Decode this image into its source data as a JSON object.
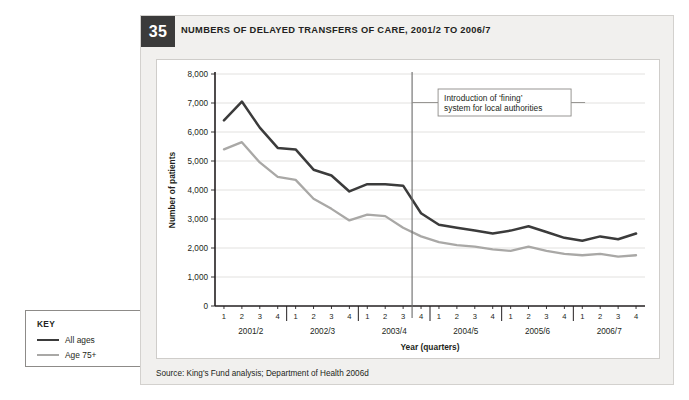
{
  "figure": {
    "number": "35",
    "title": "NUMBERS OF DELAYED TRANSFERS OF CARE, 2001/2 TO 2006/7",
    "source": "Source: King's Fund analysis; Department of Health 2006d"
  },
  "key": {
    "title": "KEY",
    "entries": [
      {
        "label": "All ages",
        "color": "#3b3b3b"
      },
      {
        "label": "Age 75+",
        "color": "#a9a8a6"
      }
    ]
  },
  "annotation": {
    "line1": "Introduction of ‘fining’",
    "line2": "system for local authorities",
    "at_x_index": 10.5
  },
  "colors": {
    "all_ages": "#3b3b3b",
    "age_75_plus": "#a9a8a6",
    "panel_bg": "#f1f0ee",
    "badge_bg": "#3b3b3b",
    "grid": "#e2e1df",
    "axis": "#231f20"
  },
  "chart_data": {
    "type": "line",
    "title": "NUMBERS OF DELAYED TRANSFERS OF CARE, 2001/2 TO 2006/7",
    "xlabel": "Year (quarters)",
    "ylabel": "Number of patients",
    "ylim": [
      0,
      8000
    ],
    "ytick_values": [
      0,
      1000,
      2000,
      3000,
      4000,
      5000,
      6000,
      7000,
      8000
    ],
    "ytick_labels": [
      "0",
      "1,000",
      "2,000",
      "3,000",
      "4,000",
      "5,000",
      "6,000",
      "7,000",
      "8,000"
    ],
    "grid": "horizontal",
    "legend_position": "external-left-key-box",
    "x_groups": [
      "2001/2",
      "2002/3",
      "2003/4",
      "2004/5",
      "2005/6",
      "2006/7"
    ],
    "x_quarter_labels": [
      "1",
      "2",
      "3",
      "4"
    ],
    "categories": [
      "2001/2 Q1",
      "2001/2 Q2",
      "2001/2 Q3",
      "2001/2 Q4",
      "2002/3 Q1",
      "2002/3 Q2",
      "2002/3 Q3",
      "2002/3 Q4",
      "2003/4 Q1",
      "2003/4 Q2",
      "2003/4 Q3",
      "2003/4 Q4",
      "2004/5 Q1",
      "2004/5 Q2",
      "2004/5 Q3",
      "2004/5 Q4",
      "2005/6 Q1",
      "2005/6 Q2",
      "2005/6 Q3",
      "2005/6 Q4",
      "2006/7 Q1",
      "2006/7 Q2",
      "2006/7 Q3",
      "2006/7 Q4"
    ],
    "series": [
      {
        "name": "All ages",
        "color": "#3b3b3b",
        "values": [
          6400,
          7050,
          6150,
          5450,
          5400,
          4700,
          4500,
          3950,
          4200,
          4200,
          4150,
          3200,
          2800,
          2700,
          2600,
          2500,
          2600,
          2750,
          2550,
          2350,
          2250,
          2400,
          2300,
          2500
        ]
      },
      {
        "name": "Age 75+",
        "color": "#a9a8a6",
        "values": [
          5400,
          5650,
          4950,
          4450,
          4350,
          3700,
          3350,
          2950,
          3150,
          3100,
          2700,
          2400,
          2200,
          2100,
          2050,
          1950,
          1900,
          2050,
          1900,
          1800,
          1750,
          1800,
          1700,
          1750
        ]
      }
    ],
    "annotations": [
      {
        "text": "Introduction of ‘fining’ system for local authorities",
        "type": "vline-callout",
        "x_position": "between 2003/4 Q3 and 2003/4 Q4"
      }
    ]
  }
}
